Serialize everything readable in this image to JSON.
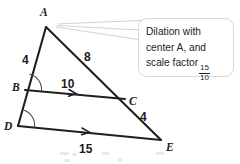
{
  "figure": {
    "vertices": [
      {
        "id": "A",
        "label": "A",
        "x": 46,
        "y": 27,
        "label_x": 40,
        "label_y": 16
      },
      {
        "id": "B",
        "label": "B",
        "x": 25,
        "y": 90,
        "label_x": 12,
        "label_y": 91
      },
      {
        "id": "C",
        "label": "C",
        "x": 125,
        "y": 99,
        "label_x": 129,
        "label_y": 105
      },
      {
        "id": "D",
        "label": "D",
        "x": 18,
        "y": 126,
        "label_x": 4,
        "label_y": 130
      },
      {
        "id": "E",
        "label": "E",
        "x": 161,
        "y": 140,
        "label_x": 166,
        "label_y": 151
      }
    ],
    "segments": [
      {
        "name": "AD",
        "from": "A",
        "to": "D"
      },
      {
        "name": "AE",
        "from": "A",
        "to": "E"
      },
      {
        "name": "BC",
        "from": "B",
        "to": "C"
      },
      {
        "name": "DE",
        "from": "D",
        "to": "E"
      }
    ],
    "side_labels": [
      {
        "name": "AB",
        "value": "4",
        "x": 22,
        "y": 64
      },
      {
        "name": "AC",
        "value": "8",
        "x": 84,
        "y": 61
      },
      {
        "name": "BC",
        "value": "10",
        "x": 61,
        "y": 88
      },
      {
        "name": "CE",
        "value": "4",
        "x": 140,
        "y": 121
      },
      {
        "name": "DE",
        "value": "15",
        "x": 79,
        "y": 153
      }
    ],
    "angle_marks": [
      {
        "at": "B",
        "note": "congruent angle arc at B"
      },
      {
        "at": "D",
        "note": "congruent angle arc at D"
      }
    ],
    "parallel_marks": [
      {
        "on": "BC",
        "count": 1
      },
      {
        "on": "DE",
        "count": 1
      }
    ]
  },
  "callout": {
    "line1": "Dilation with",
    "line2": "center A, and",
    "line3": "scale factor",
    "fraction_numerator": "15",
    "fraction_denominator": "10"
  },
  "colors": {
    "stroke": "#231f20",
    "leader": "#d2d2d2",
    "callout_border": "#d8d8d8",
    "text": "#232323",
    "background": "#ffffff"
  }
}
